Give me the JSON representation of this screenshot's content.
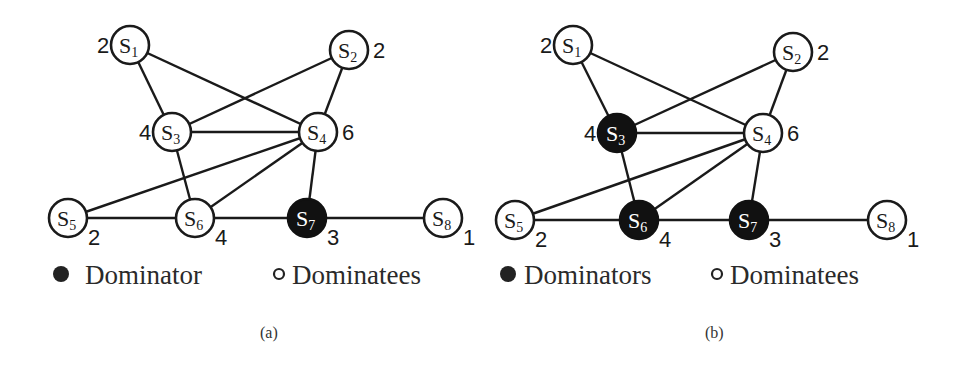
{
  "colors": {
    "line": "#1a1a1a",
    "dominator_fill": "#111111",
    "dominatee_fill": "#ffffff"
  },
  "node_radius": 19,
  "edges": [
    [
      "S1",
      "S3"
    ],
    [
      "S1",
      "S4"
    ],
    [
      "S2",
      "S3"
    ],
    [
      "S2",
      "S4"
    ],
    [
      "S3",
      "S4"
    ],
    [
      "S3",
      "S6"
    ],
    [
      "S4",
      "S5"
    ],
    [
      "S4",
      "S6"
    ],
    [
      "S4",
      "S7"
    ],
    [
      "S5",
      "S6"
    ],
    [
      "S6",
      "S7"
    ],
    [
      "S7",
      "S8"
    ]
  ],
  "panels": [
    {
      "id": "a",
      "caption": "(a)",
      "caption_pos": [
        260,
        338
      ],
      "legend": {
        "dominator_label": "Dominator",
        "dominatee_label": "Dominatees",
        "dominator_dot": [
          61,
          274
        ],
        "dominator_text": [
          85,
          284
        ],
        "dominatee_dot": [
          279,
          274
        ],
        "dominatee_text": [
          292,
          284
        ]
      },
      "nodes": [
        {
          "id": "S1",
          "letter": "S",
          "sub": "1",
          "x": 130,
          "y": 45,
          "degree": "2",
          "deg_pos": [
            97,
            53
          ],
          "dominator": false
        },
        {
          "id": "S2",
          "letter": "S",
          "sub": "2",
          "x": 349,
          "y": 50,
          "degree": "2",
          "deg_pos": [
            373,
            58
          ],
          "dominator": false
        },
        {
          "id": "S3",
          "letter": "S",
          "sub": "3",
          "x": 172,
          "y": 132,
          "degree": "4",
          "deg_pos": [
            139,
            140
          ],
          "dominator": false
        },
        {
          "id": "S4",
          "letter": "S",
          "sub": "4",
          "x": 318,
          "y": 132,
          "degree": "6",
          "deg_pos": [
            342,
            140
          ],
          "dominator": false
        },
        {
          "id": "S5",
          "letter": "S",
          "sub": "5",
          "x": 68,
          "y": 218,
          "degree": "2",
          "deg_pos": [
            88,
            245
          ],
          "dominator": false
        },
        {
          "id": "S6",
          "letter": "S",
          "sub": "6",
          "x": 195,
          "y": 218,
          "degree": "4",
          "deg_pos": [
            215,
            245
          ],
          "dominator": false
        },
        {
          "id": "S7",
          "letter": "S",
          "sub": "7",
          "x": 307,
          "y": 218,
          "degree": "3",
          "deg_pos": [
            327,
            245
          ],
          "dominator": true
        },
        {
          "id": "S8",
          "letter": "S",
          "sub": "8",
          "x": 443,
          "y": 218,
          "degree": "1",
          "deg_pos": [
            463,
            245
          ],
          "dominator": false
        }
      ]
    },
    {
      "id": "b",
      "caption": "(b)",
      "caption_pos": [
        705,
        338
      ],
      "legend": {
        "dominator_label": "Dominators",
        "dominatee_label": "Dominatees",
        "dominator_dot": [
          508,
          274
        ],
        "dominator_text": [
          524,
          284
        ],
        "dominatee_dot": [
          717,
          274
        ],
        "dominatee_text": [
          730,
          284
        ]
      },
      "nodes": [
        {
          "id": "S1",
          "letter": "S",
          "sub": "1",
          "x": 573,
          "y": 45,
          "degree": "2",
          "deg_pos": [
            540,
            53
          ],
          "dominator": false
        },
        {
          "id": "S2",
          "letter": "S",
          "sub": "2",
          "x": 793,
          "y": 52,
          "degree": "2",
          "deg_pos": [
            817,
            60
          ],
          "dominator": false
        },
        {
          "id": "S3",
          "letter": "S",
          "sub": "3",
          "x": 617,
          "y": 133,
          "degree": "4",
          "deg_pos": [
            584,
            141
          ],
          "dominator": true
        },
        {
          "id": "S4",
          "letter": "S",
          "sub": "4",
          "x": 763,
          "y": 133,
          "degree": "6",
          "deg_pos": [
            787,
            141
          ],
          "dominator": false
        },
        {
          "id": "S5",
          "letter": "S",
          "sub": "5",
          "x": 515,
          "y": 220,
          "degree": "2",
          "deg_pos": [
            535,
            247
          ],
          "dominator": false
        },
        {
          "id": "S6",
          "letter": "S",
          "sub": "6",
          "x": 639,
          "y": 220,
          "degree": "4",
          "deg_pos": [
            659,
            247
          ],
          "dominator": true
        },
        {
          "id": "S7",
          "letter": "S",
          "sub": "7",
          "x": 749,
          "y": 220,
          "degree": "3",
          "deg_pos": [
            769,
            247
          ],
          "dominator": true
        },
        {
          "id": "S8",
          "letter": "S",
          "sub": "8",
          "x": 887,
          "y": 220,
          "degree": "1",
          "deg_pos": [
            907,
            247
          ],
          "dominator": false
        }
      ]
    }
  ]
}
